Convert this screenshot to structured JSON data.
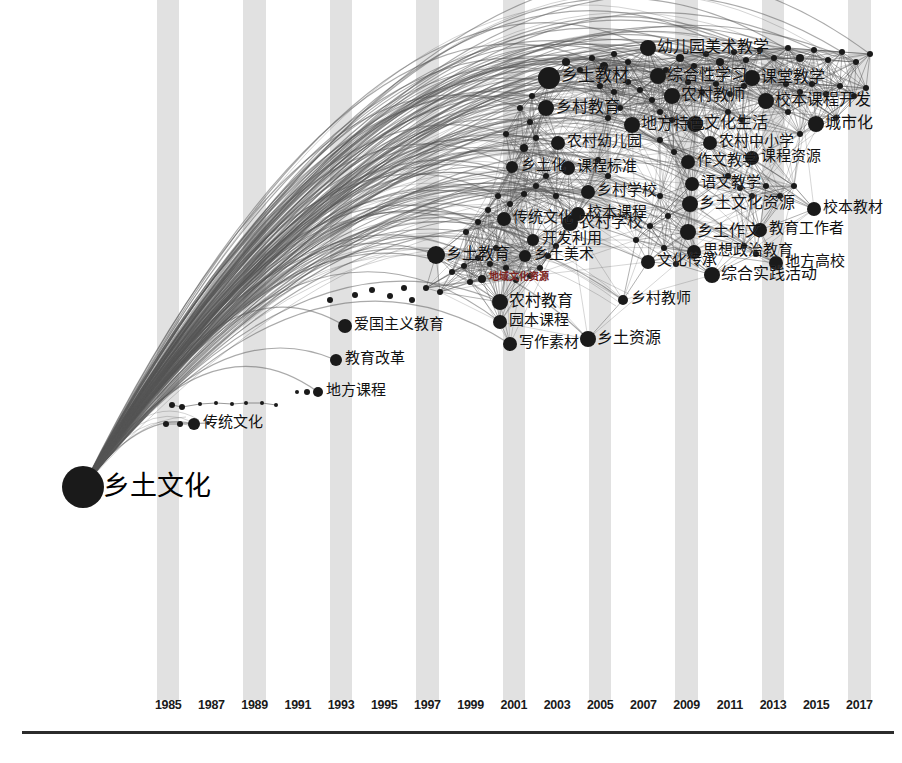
{
  "figure": {
    "type": "keyword-timeline-network",
    "root_keyword": "乡土文化",
    "axis_label": "",
    "background_band_color": "#dcdcdc",
    "node_color": "#1a1a1a",
    "edge_color": "#555555",
    "highlight_color": "#7a2220"
  },
  "axis": {
    "years": [
      "1985",
      "1987",
      "1989",
      "1991",
      "1993",
      "1995",
      "1997",
      "1999",
      "2001",
      "2003",
      "2005",
      "2007",
      "2009",
      "2011",
      "2013",
      "2015",
      "2017"
    ],
    "x_positions": [
      178,
      232,
      286,
      340,
      394,
      448,
      502,
      556,
      610,
      664,
      718,
      772,
      826,
      880,
      934,
      988,
      1042
    ],
    "line_y": 731
  },
  "chart_data": {
    "type": "scatter",
    "title": "",
    "xlabel": "",
    "ylabel": "",
    "grid": false,
    "legend": "none",
    "xlim": [
      1984,
      2018
    ],
    "categories": [
      "1985",
      "1987",
      "1989",
      "1991",
      "1993",
      "1995",
      "1997",
      "1999",
      "2001",
      "2003",
      "2005",
      "2007",
      "2009",
      "2011",
      "2013",
      "2015",
      "2017"
    ],
    "nodes": [
      {
        "label": "乡土文化",
        "x": 83,
        "y": 487,
        "r": 21,
        "size": 21,
        "label_dx": 20,
        "label_dy": -15,
        "style": "root"
      },
      {
        "label": "传统文化",
        "x": 194,
        "y": 424,
        "r": 6,
        "size": 6,
        "label_dx": 9,
        "label_dy": -9
      },
      {
        "label": "地方课程",
        "x": 318,
        "y": 392,
        "r": 5,
        "size": 5,
        "label_dx": 8,
        "label_dy": -9
      },
      {
        "label": "教育改革",
        "x": 336,
        "y": 360,
        "r": 6,
        "size": 6,
        "label_dx": 9,
        "label_dy": -9
      },
      {
        "label": "爱国主义教育",
        "x": 345,
        "y": 326,
        "r": 7,
        "size": 7,
        "label_dx": 9,
        "label_dy": -9
      },
      {
        "label": "乡土教育",
        "x": 436,
        "y": 255,
        "r": 9,
        "size": 9,
        "label_dx": 10,
        "label_dy": -9
      },
      {
        "label": "传统文化",
        "x": 504,
        "y": 219,
        "r": 7,
        "size": 7,
        "label_dx": 9,
        "label_dy": -9
      },
      {
        "label": "农村学校",
        "x": 570,
        "y": 223,
        "r": 8,
        "size": 8,
        "label_dx": 9,
        "label_dy": -9
      },
      {
        "label": "开发利用",
        "x": 533,
        "y": 240,
        "r": 6,
        "size": 6,
        "label_dx": 9,
        "label_dy": -9
      },
      {
        "label": "乡土美术",
        "x": 525,
        "y": 256,
        "r": 6,
        "size": 6,
        "label_dx": 9,
        "label_dy": -9
      },
      {
        "label": "地域文化资源",
        "x": 482,
        "y": 279,
        "r": 4,
        "size": 4,
        "label_dx": 7,
        "label_dy": -7,
        "style": "red",
        "font": 10
      },
      {
        "label": "农村教育",
        "x": 500,
        "y": 302,
        "r": 8,
        "size": 8,
        "label_dx": 9,
        "label_dy": -9
      },
      {
        "label": "园本课程",
        "x": 500,
        "y": 322,
        "r": 7,
        "size": 7,
        "label_dx": 9,
        "label_dy": -9
      },
      {
        "label": "写作素材",
        "x": 510,
        "y": 344,
        "r": 7,
        "size": 7,
        "label_dx": 9,
        "label_dy": -9
      },
      {
        "label": "乡土资源",
        "x": 588,
        "y": 339,
        "r": 8,
        "size": 8,
        "label_dx": 9,
        "label_dy": -9
      },
      {
        "label": "乡村教师",
        "x": 623,
        "y": 300,
        "r": 5,
        "size": 5,
        "label_dx": 8,
        "label_dy": -9
      },
      {
        "label": "乡土教材",
        "x": 549,
        "y": 78,
        "r": 11,
        "size": 11,
        "label_dx": 12,
        "label_dy": -11
      },
      {
        "label": "乡村教育",
        "x": 546,
        "y": 108,
        "r": 8,
        "size": 8,
        "label_dx": 10,
        "label_dy": -9
      },
      {
        "label": "农村幼儿园",
        "x": 558,
        "y": 143,
        "r": 7,
        "size": 7,
        "label_dx": 9,
        "label_dy": -9
      },
      {
        "label": "乡土化",
        "x": 512,
        "y": 167,
        "r": 6,
        "size": 6,
        "label_dx": 9,
        "label_dy": -9
      },
      {
        "label": "课程标准",
        "x": 568,
        "y": 168,
        "r": 7,
        "size": 7,
        "label_dx": 9,
        "label_dy": -9
      },
      {
        "label": "乡村学校",
        "x": 588,
        "y": 192,
        "r": 7,
        "size": 7,
        "label_dx": 9,
        "label_dy": -9
      },
      {
        "label": "校本课程",
        "x": 578,
        "y": 214,
        "r": 7,
        "size": 7,
        "label_dx": 9,
        "label_dy": -9
      },
      {
        "label": "地方特色",
        "x": 632,
        "y": 125,
        "r": 8,
        "size": 8,
        "label_dx": 9,
        "label_dy": -9
      },
      {
        "label": "文化生活",
        "x": 695,
        "y": 124,
        "r": 8,
        "size": 8,
        "label_dx": 9,
        "label_dy": -9
      },
      {
        "label": "农村中小学",
        "x": 710,
        "y": 143,
        "r": 7,
        "size": 7,
        "label_dx": 9,
        "label_dy": -9
      },
      {
        "label": "作文教学",
        "x": 688,
        "y": 162,
        "r": 7,
        "size": 7,
        "label_dx": 9,
        "label_dy": -9
      },
      {
        "label": "课程资源",
        "x": 752,
        "y": 158,
        "r": 7,
        "size": 7,
        "label_dx": 9,
        "label_dy": -9
      },
      {
        "label": "语文教学",
        "x": 692,
        "y": 184,
        "r": 7,
        "size": 7,
        "label_dx": 9,
        "label_dy": -9
      },
      {
        "label": "乡土文化资源",
        "x": 690,
        "y": 204,
        "r": 8,
        "size": 8,
        "label_dx": 9,
        "label_dy": -9
      },
      {
        "label": "校本教材",
        "x": 814,
        "y": 209,
        "r": 7,
        "size": 7,
        "label_dx": 9,
        "label_dy": -9
      },
      {
        "label": "乡土作文",
        "x": 688,
        "y": 232,
        "r": 8,
        "size": 8,
        "label_dx": 9,
        "label_dy": -9
      },
      {
        "label": "教育工作者",
        "x": 760,
        "y": 230,
        "r": 7,
        "size": 7,
        "label_dx": 9,
        "label_dy": -9
      },
      {
        "label": "思想政治教育",
        "x": 694,
        "y": 252,
        "r": 7,
        "size": 7,
        "label_dx": 9,
        "label_dy": -9
      },
      {
        "label": "文化传承",
        "x": 648,
        "y": 262,
        "r": 7,
        "size": 7,
        "label_dx": 9,
        "label_dy": -9
      },
      {
        "label": "综合实践活动",
        "x": 712,
        "y": 275,
        "r": 8,
        "size": 8,
        "label_dx": 9,
        "label_dy": -9
      },
      {
        "label": "地方高校",
        "x": 776,
        "y": 263,
        "r": 7,
        "size": 7,
        "label_dx": 9,
        "label_dy": -9
      },
      {
        "label": "幼儿园美术教学",
        "x": 648,
        "y": 48,
        "r": 8,
        "size": 8,
        "label_dx": 9,
        "label_dy": -9
      },
      {
        "label": "综合性学习",
        "x": 658,
        "y": 76,
        "r": 8,
        "size": 8,
        "label_dx": 9,
        "label_dy": -9
      },
      {
        "label": "课堂教学",
        "x": 752,
        "y": 78,
        "r": 8,
        "size": 8,
        "label_dx": 9,
        "label_dy": -9
      },
      {
        "label": "农村教师",
        "x": 672,
        "y": 96,
        "r": 8,
        "size": 8,
        "label_dx": 9,
        "label_dy": -9
      },
      {
        "label": "校本课程开发",
        "x": 766,
        "y": 101,
        "r": 8,
        "size": 8,
        "label_dx": 9,
        "label_dy": -9
      },
      {
        "label": "城市化",
        "x": 816,
        "y": 124,
        "r": 8,
        "size": 8,
        "label_dx": 9,
        "label_dy": -9
      }
    ]
  },
  "minor_nodes": [
    {
      "x": 172,
      "y": 405,
      "r": 3
    },
    {
      "x": 182,
      "y": 407,
      "r": 3
    },
    {
      "x": 200,
      "y": 404,
      "r": 2
    },
    {
      "x": 216,
      "y": 403,
      "r": 2
    },
    {
      "x": 232,
      "y": 404,
      "r": 2
    },
    {
      "x": 246,
      "y": 403,
      "r": 2
    },
    {
      "x": 262,
      "y": 403,
      "r": 2
    },
    {
      "x": 276,
      "y": 405,
      "r": 2
    },
    {
      "x": 166,
      "y": 424,
      "r": 3
    },
    {
      "x": 180,
      "y": 424,
      "r": 3
    },
    {
      "x": 208,
      "y": 423,
      "r": 2
    },
    {
      "x": 307,
      "y": 392,
      "r": 3
    },
    {
      "x": 297,
      "y": 392,
      "r": 2
    },
    {
      "x": 330,
      "y": 300,
      "r": 3
    },
    {
      "x": 355,
      "y": 295,
      "r": 3
    },
    {
      "x": 372,
      "y": 290,
      "r": 3
    },
    {
      "x": 390,
      "y": 296,
      "r": 3
    },
    {
      "x": 404,
      "y": 288,
      "r": 3
    },
    {
      "x": 412,
      "y": 300,
      "r": 3
    },
    {
      "x": 426,
      "y": 288,
      "r": 3
    },
    {
      "x": 440,
      "y": 292,
      "r": 3
    },
    {
      "x": 452,
      "y": 272,
      "r": 3
    },
    {
      "x": 464,
      "y": 266,
      "r": 3
    },
    {
      "x": 470,
      "y": 282,
      "r": 3
    },
    {
      "x": 478,
      "y": 258,
      "r": 3
    },
    {
      "x": 490,
      "y": 264,
      "r": 3
    },
    {
      "x": 496,
      "y": 248,
      "r": 3
    },
    {
      "x": 506,
      "y": 268,
      "r": 3
    },
    {
      "x": 516,
      "y": 280,
      "r": 3
    },
    {
      "x": 530,
      "y": 276,
      "r": 3
    },
    {
      "x": 540,
      "y": 268,
      "r": 3
    },
    {
      "x": 548,
      "y": 256,
      "r": 3
    },
    {
      "x": 556,
      "y": 246,
      "r": 3
    },
    {
      "x": 466,
      "y": 232,
      "r": 3
    },
    {
      "x": 478,
      "y": 222,
      "r": 3
    },
    {
      "x": 488,
      "y": 210,
      "r": 3
    },
    {
      "x": 498,
      "y": 196,
      "r": 3
    },
    {
      "x": 510,
      "y": 204,
      "r": 3
    },
    {
      "x": 524,
      "y": 194,
      "r": 3
    },
    {
      "x": 536,
      "y": 186,
      "r": 3
    },
    {
      "x": 546,
      "y": 176,
      "r": 3
    },
    {
      "x": 556,
      "y": 196,
      "r": 3
    },
    {
      "x": 524,
      "y": 148,
      "r": 4
    },
    {
      "x": 536,
      "y": 138,
      "r": 3
    },
    {
      "x": 506,
      "y": 134,
      "r": 3
    },
    {
      "x": 530,
      "y": 122,
      "r": 3
    },
    {
      "x": 520,
      "y": 108,
      "r": 3
    },
    {
      "x": 532,
      "y": 96,
      "r": 3
    },
    {
      "x": 566,
      "y": 62,
      "r": 4
    },
    {
      "x": 580,
      "y": 70,
      "r": 3
    },
    {
      "x": 592,
      "y": 58,
      "r": 3
    },
    {
      "x": 604,
      "y": 66,
      "r": 4
    },
    {
      "x": 614,
      "y": 54,
      "r": 3
    },
    {
      "x": 628,
      "y": 62,
      "r": 3
    },
    {
      "x": 600,
      "y": 86,
      "r": 3
    },
    {
      "x": 614,
      "y": 92,
      "r": 3
    },
    {
      "x": 628,
      "y": 82,
      "r": 3
    },
    {
      "x": 640,
      "y": 90,
      "r": 3
    },
    {
      "x": 652,
      "y": 100,
      "r": 3
    },
    {
      "x": 666,
      "y": 70,
      "r": 3
    },
    {
      "x": 680,
      "y": 58,
      "r": 4
    },
    {
      "x": 694,
      "y": 66,
      "r": 3
    },
    {
      "x": 706,
      "y": 54,
      "r": 3
    },
    {
      "x": 720,
      "y": 62,
      "r": 4
    },
    {
      "x": 734,
      "y": 52,
      "r": 3
    },
    {
      "x": 746,
      "y": 60,
      "r": 3
    },
    {
      "x": 760,
      "y": 50,
      "r": 3
    },
    {
      "x": 774,
      "y": 58,
      "r": 3
    },
    {
      "x": 788,
      "y": 48,
      "r": 3
    },
    {
      "x": 800,
      "y": 58,
      "r": 4
    },
    {
      "x": 814,
      "y": 50,
      "r": 3
    },
    {
      "x": 828,
      "y": 60,
      "r": 3
    },
    {
      "x": 842,
      "y": 52,
      "r": 3
    },
    {
      "x": 856,
      "y": 62,
      "r": 3
    },
    {
      "x": 870,
      "y": 54,
      "r": 3
    },
    {
      "x": 688,
      "y": 82,
      "r": 3
    },
    {
      "x": 702,
      "y": 92,
      "r": 3
    },
    {
      "x": 716,
      "y": 84,
      "r": 3
    },
    {
      "x": 730,
      "y": 94,
      "r": 3
    },
    {
      "x": 744,
      "y": 86,
      "r": 3
    },
    {
      "x": 786,
      "y": 84,
      "r": 3
    },
    {
      "x": 800,
      "y": 92,
      "r": 3
    },
    {
      "x": 812,
      "y": 84,
      "r": 3
    },
    {
      "x": 826,
      "y": 94,
      "r": 3
    },
    {
      "x": 840,
      "y": 86,
      "r": 3
    },
    {
      "x": 854,
      "y": 96,
      "r": 3
    },
    {
      "x": 866,
      "y": 88,
      "r": 3
    },
    {
      "x": 620,
      "y": 108,
      "r": 3
    },
    {
      "x": 608,
      "y": 118,
      "r": 3
    },
    {
      "x": 660,
      "y": 112,
      "r": 3
    },
    {
      "x": 672,
      "y": 120,
      "r": 3
    },
    {
      "x": 728,
      "y": 112,
      "r": 3
    },
    {
      "x": 742,
      "y": 120,
      "r": 3
    },
    {
      "x": 788,
      "y": 112,
      "r": 3
    },
    {
      "x": 800,
      "y": 134,
      "r": 3
    },
    {
      "x": 836,
      "y": 118,
      "r": 3
    },
    {
      "x": 660,
      "y": 140,
      "r": 3
    },
    {
      "x": 674,
      "y": 152,
      "r": 3
    },
    {
      "x": 728,
      "y": 176,
      "r": 3
    },
    {
      "x": 740,
      "y": 188,
      "r": 3
    },
    {
      "x": 752,
      "y": 196,
      "r": 3
    },
    {
      "x": 766,
      "y": 186,
      "r": 3
    },
    {
      "x": 780,
      "y": 196,
      "r": 3
    },
    {
      "x": 794,
      "y": 186,
      "r": 3
    },
    {
      "x": 660,
      "y": 196,
      "r": 3
    },
    {
      "x": 668,
      "y": 216,
      "r": 3
    },
    {
      "x": 650,
      "y": 226,
      "r": 3
    },
    {
      "x": 636,
      "y": 240,
      "r": 3
    },
    {
      "x": 664,
      "y": 248,
      "r": 3
    },
    {
      "x": 676,
      "y": 264,
      "r": 3
    },
    {
      "x": 744,
      "y": 246,
      "r": 3
    },
    {
      "x": 756,
      "y": 254,
      "r": 3
    },
    {
      "x": 608,
      "y": 176,
      "r": 3
    },
    {
      "x": 598,
      "y": 160,
      "r": 3
    }
  ]
}
